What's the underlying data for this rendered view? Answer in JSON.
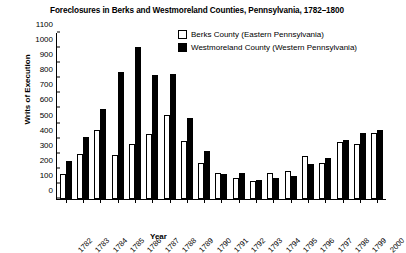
{
  "chart_data": {
    "type": "bar",
    "title": "Foreclosures in Berks and Westmoreland Counties, Pennsylvania, 1782–1800",
    "xlabel": "Year",
    "ylabel": "Writs of Execution",
    "ylim": [
      0,
      1100
    ],
    "ytick_step": 100,
    "grid": false,
    "legend_position": "top-right",
    "categories": [
      "1782",
      "1783",
      "1784",
      "1785",
      "1786",
      "1787",
      "1788",
      "1789",
      "1790",
      "1791",
      "1792",
      "1793",
      "1794",
      "1795",
      "1796",
      "1797",
      "1798",
      "1799",
      "2000"
    ],
    "yticks": [
      "0",
      "100",
      "200",
      "300",
      "400",
      "500",
      "600",
      "700",
      "800",
      "900",
      "1000",
      "1100"
    ],
    "series": [
      {
        "name": "Berks County (Eastern Pennsylvania)",
        "style": "hollow",
        "color": "#ffffff",
        "values": [
          165,
          300,
          455,
          290,
          365,
          430,
          560,
          385,
          240,
          175,
          140,
          120,
          170,
          185,
          285,
          240,
          380,
          362,
          440
        ]
      },
      {
        "name": "Westmoreland County (Western Pennsylvania)",
        "style": "filled",
        "color": "#000000",
        "values": [
          250,
          410,
          595,
          840,
          1010,
          820,
          830,
          540,
          315,
          165,
          170,
          125,
          140,
          155,
          230,
          270,
          390,
          440,
          460
        ]
      }
    ]
  },
  "legend": {
    "items": [
      {
        "label": "Berks County (Eastern Pennsylvania)",
        "style": "hollow"
      },
      {
        "label": "Westmoreland County (Western Pennsylvania)",
        "style": "filled"
      }
    ]
  }
}
